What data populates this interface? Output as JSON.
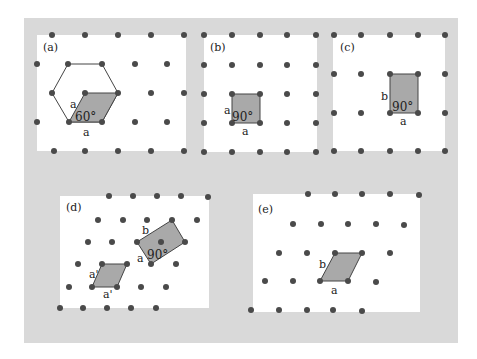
{
  "figure": {
    "background": "#d9d9d9",
    "panel_bg": "#ffffff",
    "dot_color": "#4a4a4a",
    "cell_fill": "#a9a9a9",
    "cell_stroke": "#444444"
  },
  "panels": [
    {
      "id": "a",
      "label": "(a)",
      "lattice": "hexagonal",
      "edge_labels": [
        "a",
        "a"
      ],
      "angle_label": "60°"
    },
    {
      "id": "b",
      "label": "(b)",
      "lattice": "square",
      "edge_labels": [
        "a",
        "a"
      ],
      "angle_label": "90°"
    },
    {
      "id": "c",
      "label": "(c)",
      "lattice": "rectangular",
      "edge_labels": [
        "b",
        "a"
      ],
      "angle_label": "90°"
    },
    {
      "id": "d",
      "label": "(d)",
      "lattice": "centered rectangular",
      "edge_labels": [
        "a'",
        "a'",
        "b",
        "a"
      ],
      "angle_label": "90°"
    },
    {
      "id": "e",
      "label": "(e)",
      "lattice": "oblique",
      "edge_labels": [
        "b",
        "a"
      ],
      "angle_label": ""
    }
  ]
}
